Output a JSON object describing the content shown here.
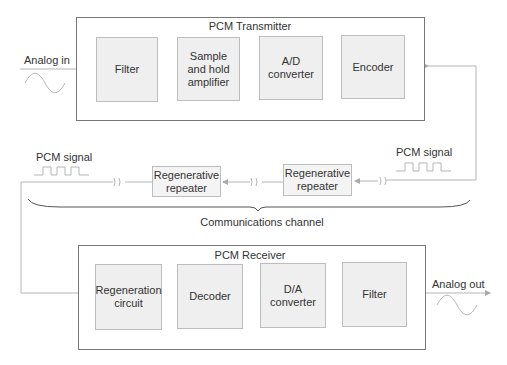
{
  "transmitter": {
    "title": "PCM Transmitter",
    "blocks": [
      {
        "label": "Filter"
      },
      {
        "label": "Sample\nand hold\namplifier"
      },
      {
        "label": "A/D\nconverter"
      },
      {
        "label": "Encoder"
      }
    ]
  },
  "channel": {
    "input_label": "Analog in",
    "pcm_signal_right": "PCM signal",
    "pcm_signal_left": "PCM signal",
    "repeaters": [
      {
        "label": "Regenerative\nrepeater"
      },
      {
        "label": "Regenerative\nrepeater"
      }
    ],
    "brace_label": "Communications channel"
  },
  "receiver": {
    "title": "PCM Receiver",
    "blocks": [
      {
        "label": "Regeneration\ncircuit"
      },
      {
        "label": "Decoder"
      },
      {
        "label": "D/A\nconverter"
      },
      {
        "label": "Filter"
      }
    ],
    "output_label": "Analog out"
  },
  "colors": {
    "frame_border": "#777777",
    "block_fill": "#efefef",
    "block_border": "#bdbdbd",
    "wire": "#b5b5b5",
    "text": "#333333"
  }
}
